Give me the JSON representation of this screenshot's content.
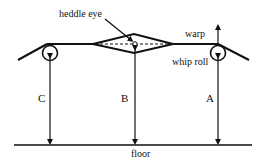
{
  "diagram": {
    "labels": {
      "heddle_eye": "heddle eye",
      "warp": "warp",
      "whip_roll": "whip roll",
      "floor": "floor",
      "height_c": "C",
      "height_b": "B",
      "height_a": "A"
    },
    "colors": {
      "stroke": "#111111",
      "background": "#ffffff"
    }
  }
}
